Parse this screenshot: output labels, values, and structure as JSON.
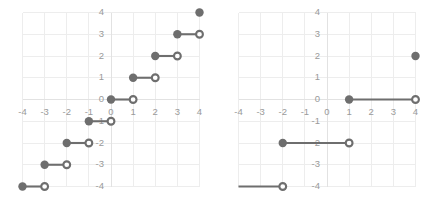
{
  "figure": {
    "title": "",
    "panel_count": 2
  },
  "chart_data": [
    {
      "type": "line",
      "panel": "left",
      "title": "",
      "xlabel": "",
      "ylabel": "",
      "xlim": [
        -4.6,
        4.6
      ],
      "ylim": [
        -4.6,
        4.6
      ],
      "xticks": [
        -4,
        -3,
        -2,
        -1,
        0,
        1,
        2,
        3,
        4
      ],
      "yticks": [
        -4,
        -3,
        -2,
        -1,
        0,
        1,
        2,
        3,
        4
      ],
      "xticklabels": [
        "-4",
        "-3",
        "-2",
        "-1",
        "0",
        "1",
        "2",
        "3",
        "4"
      ],
      "yticklabels": [
        "-4",
        "-3",
        "-2",
        "-1",
        "0",
        "1",
        "2",
        "3",
        "4"
      ],
      "grid": true,
      "legend": "none",
      "description": "step function, half-open segments",
      "series": [
        {
          "name": "step",
          "color": "#6e6e6e",
          "segments": [
            {
              "x0": -4,
              "x1": -3,
              "y": -4,
              "left_closed": true,
              "right_closed": false
            },
            {
              "x0": -3,
              "x1": -2,
              "y": -3,
              "left_closed": true,
              "right_closed": false
            },
            {
              "x0": -2,
              "x1": -1,
              "y": -2,
              "left_closed": true,
              "right_closed": false
            },
            {
              "x0": -1,
              "x1": 0,
              "y": -1,
              "left_closed": true,
              "right_closed": false
            },
            {
              "x0": 0,
              "x1": 1,
              "y": 0,
              "left_closed": true,
              "right_closed": false
            },
            {
              "x0": 1,
              "x1": 2,
              "y": 1,
              "left_closed": true,
              "right_closed": false
            },
            {
              "x0": 2,
              "x1": 3,
              "y": 2,
              "left_closed": true,
              "right_closed": false
            },
            {
              "x0": 3,
              "x1": 4,
              "y": 3,
              "left_closed": true,
              "right_closed": false
            }
          ],
          "isolated_points": [
            {
              "x": 4,
              "y": 4,
              "closed": true
            }
          ]
        }
      ]
    },
    {
      "type": "line",
      "panel": "right",
      "title": "",
      "xlabel": "",
      "ylabel": "",
      "xlim": [
        -4.6,
        4.6
      ],
      "ylim": [
        -4.6,
        4.6
      ],
      "xticks": [
        -4,
        -3,
        -2,
        -1,
        0,
        1,
        2,
        3,
        4
      ],
      "yticks": [
        -4,
        -3,
        -2,
        -1,
        0,
        1,
        2,
        3,
        4
      ],
      "xticklabels": [
        "-4",
        "-3",
        "-2",
        "-1",
        "0",
        "1",
        "2",
        "3",
        "4"
      ],
      "yticklabels": [
        "-4",
        "-3",
        "-2",
        "-1",
        "0",
        "1",
        "2",
        "3",
        "4"
      ],
      "grid": true,
      "legend": "none",
      "description": "coarse step function, half-open segments",
      "series": [
        {
          "name": "step",
          "color": "#6e6e6e",
          "segments": [
            {
              "x0": -4.6,
              "x1": -2,
              "y": -4,
              "left_closed": false,
              "right_closed": false
            },
            {
              "x0": -2,
              "x1": 1,
              "y": -2,
              "left_closed": true,
              "right_closed": false
            },
            {
              "x0": 1,
              "x1": 4,
              "y": 0,
              "left_closed": true,
              "right_closed": false
            }
          ],
          "isolated_points": [
            {
              "x": 4,
              "y": 2,
              "closed": true
            }
          ]
        }
      ]
    }
  ],
  "style": {
    "marker_color": "#6e6e6e",
    "grid_color": "#ededed",
    "axis_color": "#e2e2e2",
    "tick_label_color": "#9a9a9a",
    "background": "#ffffff"
  }
}
